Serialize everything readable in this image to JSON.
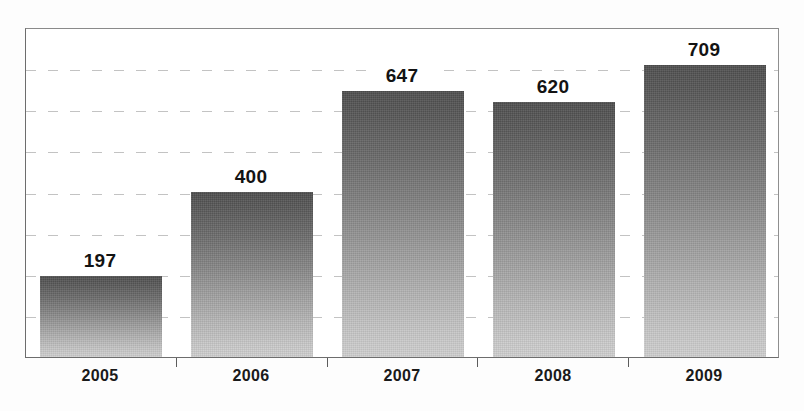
{
  "chart_data": {
    "type": "bar",
    "title": "",
    "subtitle": "",
    "xlabel": "",
    "ylabel": "",
    "categories": [
      "2005",
      "2006",
      "2007",
      "2008",
      "2009"
    ],
    "values": [
      197,
      400,
      647,
      620,
      709
    ],
    "data_labels": [
      "197",
      "400",
      "647",
      "620",
      "709"
    ],
    "ylim": [
      0,
      800
    ],
    "y_tick_interval": 100,
    "y_tick_values": [
      100,
      200,
      300,
      400,
      500,
      600,
      700
    ],
    "y_tick_labels_visible": false,
    "gridlines": {
      "horizontal": true,
      "vertical": false,
      "style": "dashed",
      "count": 7,
      "color": "#b8b8b8"
    },
    "legend": {
      "visible": false,
      "position": "none",
      "entries": []
    },
    "axis": {
      "left_line": true,
      "bottom_line": true,
      "top_line": true,
      "right_line": true,
      "tick_marks": "between-categories"
    },
    "bar_style": {
      "fill": "vertical-gradient",
      "gradient_top": "#4e4e4e",
      "gradient_bottom": "#d0d0d0",
      "border": "none"
    },
    "colors": {
      "background": "#ffffff",
      "plot_border": "#6d6d6d",
      "label_text": "#131313",
      "category_text": "#1a1a1a"
    }
  }
}
